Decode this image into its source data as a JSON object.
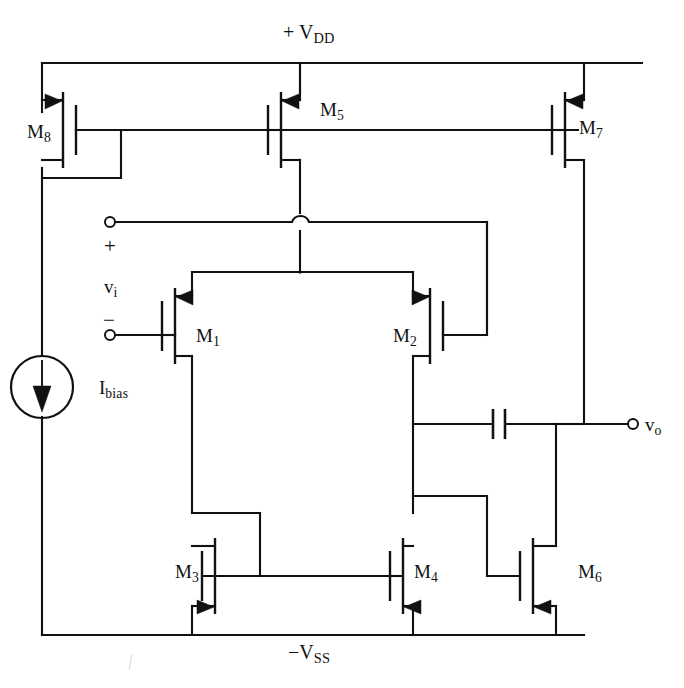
{
  "diagram": {
    "kind": "cmos-two-stage-operational-amplifier-schematic",
    "rails": {
      "top_label": "+ V",
      "top_label_sub": "DD",
      "bottom_label": "−V",
      "bottom_label_sub": "SS"
    },
    "transistors": [
      {
        "id": "M8",
        "name": "M",
        "sub": "8",
        "type": "PMOS",
        "role": "bias-mirror-diode-connected"
      },
      {
        "id": "M5",
        "name": "M",
        "sub": "5",
        "type": "PMOS",
        "role": "tail-current-source"
      },
      {
        "id": "M7",
        "name": "M",
        "sub": "7",
        "type": "PMOS",
        "role": "second-stage-current-source"
      },
      {
        "id": "M1",
        "name": "M",
        "sub": "1",
        "type": "PMOS",
        "role": "input-differential-pair-left"
      },
      {
        "id": "M2",
        "name": "M",
        "sub": "2",
        "type": "PMOS",
        "role": "input-differential-pair-right"
      },
      {
        "id": "M3",
        "name": "M",
        "sub": "3",
        "type": "NMOS",
        "role": "load-mirror-diode-connected"
      },
      {
        "id": "M4",
        "name": "M",
        "sub": "4",
        "type": "NMOS",
        "role": "load-mirror-output"
      },
      {
        "id": "M6",
        "name": "M",
        "sub": "6",
        "type": "NMOS",
        "role": "second-stage-driver"
      }
    ],
    "sources": [
      {
        "id": "Ibias",
        "name": "I",
        "sub": "bias",
        "symbol": "current-source",
        "direction": "downward"
      }
    ],
    "ports": [
      {
        "id": "vi_plus",
        "sign": "+",
        "name": "",
        "sub": "",
        "terminal": "open-circle"
      },
      {
        "id": "vi_label",
        "name": "v",
        "sub": "i",
        "terminal": "none"
      },
      {
        "id": "vi_minus",
        "sign": "−",
        "name": "",
        "sub": "",
        "terminal": "open-circle"
      },
      {
        "id": "vo",
        "name": "v",
        "sub": "o",
        "terminal": "open-circle"
      }
    ],
    "passives": [
      {
        "id": "Cc",
        "type": "capacitor",
        "role": "miller-compensation",
        "label": ""
      }
    ],
    "colors": {
      "ink": "#111111",
      "background": "#ffffff"
    }
  }
}
